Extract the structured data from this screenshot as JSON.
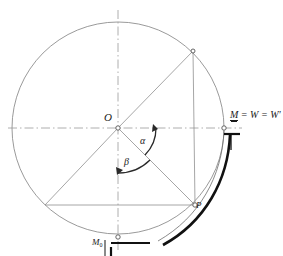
{
  "figure": {
    "type": "geometric-diagram",
    "background_color": "#ffffff",
    "line_color": "#8a8a8a",
    "heavy_line_color": "#111111",
    "text_color": "#1a1a1a"
  },
  "labels": {
    "center": "O",
    "point_p": "P",
    "angle_alpha": "α",
    "angle_beta": "β",
    "moment_zero_letter": "M",
    "moment_zero_sub": "0",
    "right_label": " = W = W′",
    "right_label_lead": "M"
  },
  "geometry": {
    "circle": {
      "cx": 118,
      "cy": 128,
      "r": 106
    },
    "center_point": {
      "x": 118,
      "y": 128
    },
    "point_p": {
      "x": 195,
      "y": 205
    },
    "point_upper_right": {
      "x": 193,
      "y": 51
    },
    "point_lower_left": {
      "x": 45,
      "y": 205
    },
    "point_right_axis": {
      "x": 224,
      "y": 128
    },
    "point_bottom": {
      "x": 118,
      "y": 234
    },
    "angle_alpha_degrees": 45,
    "angle_beta_degrees": 90
  }
}
